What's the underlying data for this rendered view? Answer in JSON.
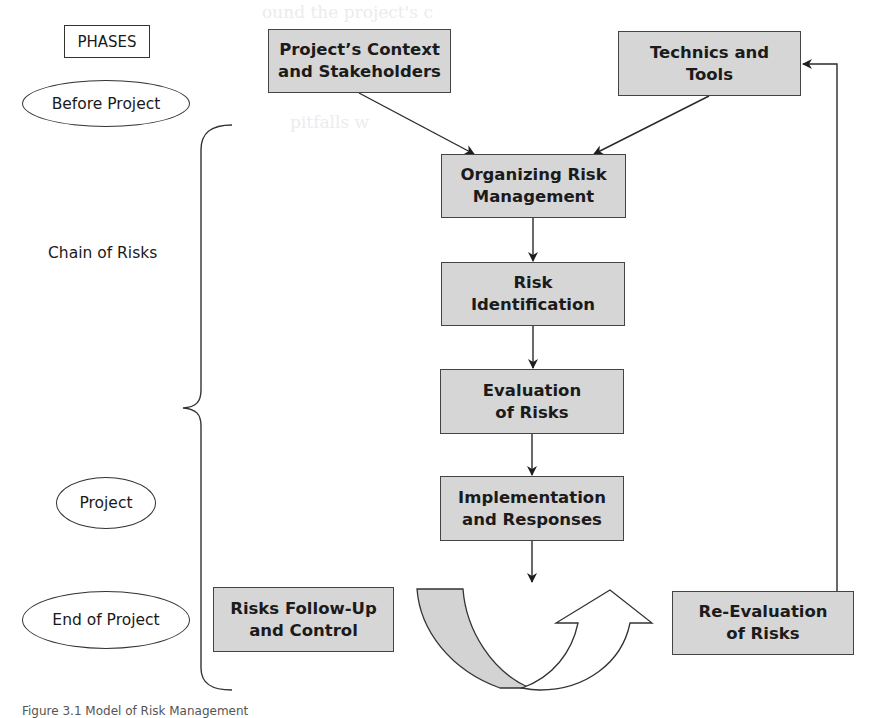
{
  "legend": {
    "phases_label": "PHASES"
  },
  "phases": [
    {
      "id": "before-project",
      "label": "Before Project"
    },
    {
      "id": "chain-of-risks",
      "label": "Chain of Risks"
    },
    {
      "id": "project",
      "label": "Project"
    },
    {
      "id": "end-of-project",
      "label": "End of Project"
    }
  ],
  "nodes": {
    "context": {
      "line1": "Project’s Context",
      "line2": "and Stakeholders"
    },
    "technics": {
      "line1": "Technics and",
      "line2": "Tools"
    },
    "organizing": {
      "line1": "Organizing Risk",
      "line2": "Management"
    },
    "identification": {
      "line1": "Risk",
      "line2": "Identification"
    },
    "evaluation": {
      "line1": "Evaluation",
      "line2": "of Risks"
    },
    "implementation": {
      "line1": "Implementation",
      "line2": "and Responses"
    },
    "followup": {
      "line1": "Risks Follow-Up",
      "line2": "and Control"
    },
    "reevaluation": {
      "line1": "Re-Evaluation",
      "line2": "of Risks"
    }
  },
  "edges": [
    {
      "from": "context",
      "to": "organizing"
    },
    {
      "from": "technics",
      "to": "organizing"
    },
    {
      "from": "organizing",
      "to": "identification"
    },
    {
      "from": "identification",
      "to": "evaluation"
    },
    {
      "from": "evaluation",
      "to": "implementation"
    },
    {
      "from": "implementation",
      "to": "cycle-arrow"
    },
    {
      "from": "cycle-arrow",
      "to": "reevaluation"
    },
    {
      "from": "reevaluation",
      "to": "technics"
    }
  ],
  "caption": "Figure 3.1  Model of Risk Management",
  "colors": {
    "box_fill": "#d6d6d6",
    "box_border": "#444444",
    "line": "#2a2a2a",
    "background": "#ffffff"
  }
}
